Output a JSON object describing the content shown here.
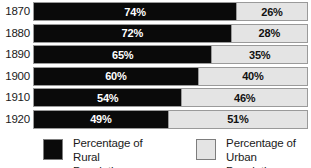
{
  "chart_data": {
    "type": "bar",
    "subtype": "stacked-horizontal-100-percent",
    "title": "",
    "xlabel": "",
    "ylabel": "",
    "xlim": [
      0,
      100
    ],
    "grid": false,
    "legend_position": "bottom",
    "orientation": "horizontal",
    "categories": [
      "1870",
      "1880",
      "1890",
      "1900",
      "1910",
      "1920"
    ],
    "series": [
      {
        "name": "Percentage of Rural Population",
        "color": "#0a0a0a",
        "values": [
          74,
          72,
          65,
          60,
          54,
          49
        ]
      },
      {
        "name": "Percentage of Urban Population",
        "color": "#e4e4e4",
        "values": [
          26,
          28,
          35,
          40,
          46,
          51
        ]
      }
    ],
    "rows": [
      {
        "year": "1870",
        "rural_value": 74,
        "urban_value": 26,
        "rural_label": "74%",
        "urban_label": "26%"
      },
      {
        "year": "1880",
        "rural_value": 72,
        "urban_value": 28,
        "rural_label": "72%",
        "urban_label": "28%"
      },
      {
        "year": "1890",
        "rural_value": 65,
        "urban_value": 35,
        "rural_label": "65%",
        "urban_label": "35%"
      },
      {
        "year": "1900",
        "rural_value": 60,
        "urban_value": 40,
        "rural_label": "60%",
        "urban_label": "40%"
      },
      {
        "year": "1910",
        "rural_value": 54,
        "urban_value": 46,
        "rural_label": "54%",
        "urban_label": "46%"
      },
      {
        "year": "1920",
        "rural_value": 49,
        "urban_value": 51,
        "rural_label": "49%",
        "urban_label": "51%"
      }
    ]
  },
  "legend": {
    "items": [
      {
        "swatch_name": "rural-swatch",
        "color": "#0a0a0a",
        "line1": "Percentage of",
        "line2": "Rural Population"
      },
      {
        "swatch_name": "urban-swatch",
        "color": "#e4e4e4",
        "line1": "Percentage of",
        "line2": "Urban Population"
      }
    ]
  }
}
